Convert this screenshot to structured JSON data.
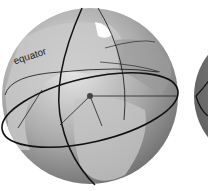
{
  "diagram": {
    "labels": {
      "equator": "equator"
    },
    "globes": [
      {
        "name": "main-globe",
        "cx": 90,
        "cy": 96,
        "r": 88
      },
      {
        "name": "partial-globe-right",
        "cx": 262,
        "cy": 96,
        "r": 68
      }
    ],
    "colors": {
      "globe_light": "#d9d9d9",
      "globe_dark": "#7a7a7a",
      "land": "#bdbdbd",
      "ice": "#ffffff",
      "lines": "#111111",
      "background": "#ffffff"
    }
  }
}
